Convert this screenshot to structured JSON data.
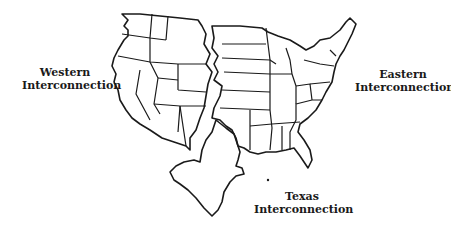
{
  "map": {
    "title": "",
    "subject": "U.S. electric grid interconnections",
    "colors": {
      "background": "#ffffff",
      "lines": "#1a1a1a",
      "text": "#1a1a1a"
    },
    "regions": [
      {
        "id": "western",
        "line1": "Western",
        "line2": "Interconnection"
      },
      {
        "id": "eastern",
        "line1": "Eastern",
        "line2": "Interconnection"
      },
      {
        "id": "texas",
        "line1": "Texas",
        "line2": "Interconnection"
      }
    ]
  }
}
